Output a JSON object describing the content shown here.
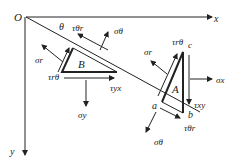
{
  "diagram": {
    "origin_label": "O",
    "axes": {
      "x": "x",
      "y": "y"
    },
    "angle_label": "θ",
    "elements": [
      {
        "id": "B",
        "label": "B"
      },
      {
        "id": "A",
        "label": "A"
      }
    ],
    "points": {
      "a": "a",
      "b": "b",
      "c": "c"
    },
    "stress_labels": {
      "sigma_theta_top": "σθ",
      "tau_theta_r_top": "τθr",
      "sigma_r_left": "σr",
      "tau_r_theta_left": "τrθ",
      "tau_yx": "τyx",
      "sigma_y": "σy",
      "sigma_r_right": "σr",
      "tau_r_theta_right": "τrθ",
      "sigma_x": "σx",
      "tau_xy": "τxy",
      "tau_theta_r_bottom": "τθr",
      "sigma_theta_bottom": "σθ"
    },
    "colors": {
      "ink": "#222222",
      "background": "#ffffff"
    }
  }
}
